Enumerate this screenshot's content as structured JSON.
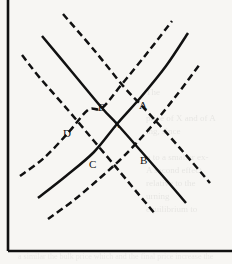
{
  "figure": {
    "background_color": "#f7f6f3",
    "ink_color": "#111111"
  },
  "axes": {
    "name": "two-axis-frame",
    "y_axis": {
      "label": "",
      "x": 8,
      "top": 0,
      "bottom": 251
    },
    "x_axis": {
      "label": "",
      "y": 251,
      "left": 8,
      "right": 232
    },
    "color": "#111111",
    "width_px": 2.6
  },
  "chart_data": {
    "type": "line",
    "xlabel": "",
    "ylabel": "",
    "grid": false,
    "legend": "none",
    "xlim": [
      0,
      232
    ],
    "ylim": [
      264,
      0
    ],
    "note": "Coordinates are in screenshot pixel space; y increases downward.",
    "series": [
      {
        "name": "demand-original",
        "role": "demand",
        "style": "solid",
        "slope": "downward",
        "points": [
          [
            42,
            36
          ],
          [
            72,
            72
          ],
          [
            102,
            108
          ],
          [
            117,
            124
          ],
          [
            140,
            150
          ],
          [
            168,
            182
          ],
          [
            186,
            203
          ]
        ]
      },
      {
        "name": "demand-shifted",
        "role": "demand",
        "style": "dashed",
        "slope": "downward",
        "points": [
          [
            63,
            14
          ],
          [
            94,
            50
          ],
          [
            124,
            87
          ],
          [
            141,
            105
          ],
          [
            164,
            130
          ],
          [
            192,
            162
          ],
          [
            210,
            183
          ]
        ]
      },
      {
        "name": "demand-shifted-left",
        "role": "demand",
        "style": "dashed",
        "slope": "downward",
        "points": [
          [
            22,
            55
          ],
          [
            40,
            78
          ],
          [
            68,
            110
          ],
          [
            94,
            141
          ],
          [
            120,
            172
          ],
          [
            140,
            196
          ],
          [
            156,
            215
          ]
        ]
      },
      {
        "name": "supply-original",
        "role": "supply",
        "style": "solid",
        "slope": "upward",
        "points": [
          [
            38,
            198
          ],
          [
            66,
            176
          ],
          [
            94,
            152
          ],
          [
            117,
            124
          ],
          [
            141,
            97
          ],
          [
            166,
            66
          ],
          [
            188,
            33
          ]
        ]
      },
      {
        "name": "supply-shifted-up",
        "role": "supply",
        "style": "dashed",
        "slope": "upward",
        "points": [
          [
            20,
            176
          ],
          [
            44,
            158
          ],
          [
            68,
            133
          ],
          [
            88,
            110
          ],
          [
            102,
            108
          ],
          [
            122,
            84
          ],
          [
            148,
            52
          ],
          [
            172,
            21
          ]
        ]
      },
      {
        "name": "supply-shifted-down",
        "role": "supply",
        "style": "dashed",
        "slope": "upward",
        "points": [
          [
            48,
            219
          ],
          [
            74,
            200
          ],
          [
            100,
            178
          ],
          [
            124,
            156
          ],
          [
            150,
            128
          ],
          [
            176,
            96
          ],
          [
            200,
            64
          ]
        ]
      }
    ],
    "annotations": [
      {
        "label": "E",
        "x": 102,
        "y": 108,
        "label_x": 98,
        "label_y": 102,
        "description": "intersection of solid demand and upper dashed supply"
      },
      {
        "label": "A",
        "x": 141,
        "y": 105,
        "label_x": 139,
        "label_y": 100,
        "description": "intersection of dashed demand and solid supply"
      },
      {
        "label": "X",
        "x": 117,
        "y": 124,
        "label_x": 113,
        "label_y": 119,
        "description": "central equilibrium of solid demand and solid supply"
      },
      {
        "label": "D",
        "x": 68,
        "y": 133,
        "label_x": 64,
        "label_y": 128,
        "description": "intersection of left dashed demand and upper dashed supply"
      },
      {
        "label": "C",
        "x": 94,
        "y": 152,
        "label_x": 90,
        "label_y": 159,
        "description": "intersection of left dashed demand and solid supply"
      },
      {
        "label": "B",
        "x": 141,
        "y": 157,
        "label_x": 140,
        "label_y": 155,
        "description": "intersection of dashed demand and lower dashed supply"
      }
    ]
  },
  "labels": {
    "E": "E",
    "A": "A",
    "X": "X",
    "D": "D",
    "C": "C",
    "B": "B"
  },
  "page_bleed": {
    "right_margin_text": "The\n\nprice of X and of A\ning, since\n\no to a smaller ex-\nA second effect\nrelative to the\nurning\nequilibrium to",
    "bottom_text": "a similar  the bulk  price  which\nand  the  final  price  increase  the"
  }
}
